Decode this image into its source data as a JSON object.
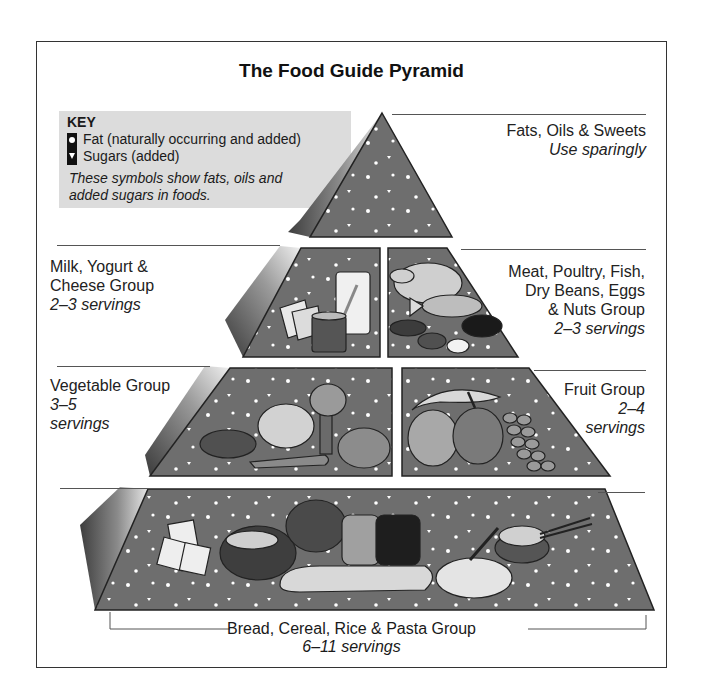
{
  "title": "The Food Guide Pyramid",
  "key": {
    "heading": "KEY",
    "items": [
      {
        "symbol": "circle-dot",
        "label": "Fat (naturally occurring and added)"
      },
      {
        "symbol": "triangle-down",
        "label": "Sugars (added)"
      }
    ],
    "note_line1": "These symbols show fats, oils and",
    "note_line2": "added sugars in foods."
  },
  "groups": {
    "fats": {
      "name": "Fats, Oils & Sweets",
      "servings": "Use sparingly"
    },
    "milk": {
      "name_line1": "Milk, Yogurt &",
      "name_line2": "Cheese Group",
      "servings": "2–3 servings"
    },
    "meat": {
      "name_line1": "Meat, Poultry, Fish,",
      "name_line2": "Dry Beans, Eggs",
      "name_line3": "& Nuts Group",
      "servings": "2–3 servings"
    },
    "vegetable": {
      "name": "Vegetable Group",
      "servings_line1": "3–5",
      "servings_line2": "servings"
    },
    "fruit": {
      "name": "Fruit Group",
      "servings_line1": "2–4",
      "servings_line2": "servings"
    },
    "bread": {
      "name": "Bread, Cereal, Rice & Pasta Group",
      "servings": "6–11 servings"
    }
  },
  "tier_foods": {
    "fats": [],
    "milk": [
      "cheese",
      "yogurt cup",
      "glass of milk"
    ],
    "meat": [
      "chicken",
      "fish",
      "beans",
      "nuts",
      "steak",
      "egg"
    ],
    "vegetable": [
      "potato",
      "lettuce",
      "broccoli",
      "carrot",
      "tomato"
    ],
    "fruit": [
      "banana",
      "orange",
      "apple",
      "grapes"
    ],
    "bread": [
      "crackers",
      "cereal bowl",
      "bread loaf",
      "sliced bread",
      "baguette",
      "spaghetti",
      "rice bowl with chopsticks"
    ]
  },
  "colors": {
    "tier_face": "#6e6e6e",
    "tier_outline": "#222222",
    "side_dark": "#4a4a4a",
    "side_light": "#d8d8d8",
    "key_bg": "#dcdcdc",
    "speckle": "#ffffff"
  }
}
